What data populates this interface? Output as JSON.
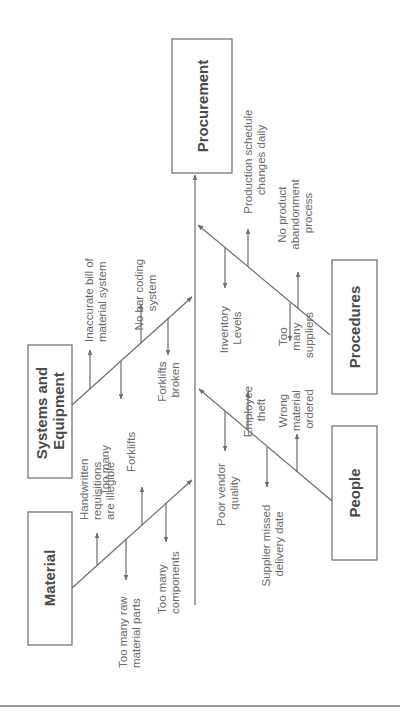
{
  "diagram": {
    "type": "fishbone",
    "orientation": "rotated-90-ccw",
    "effect": {
      "label": "Procurement"
    },
    "categories": [
      {
        "id": "material",
        "label": "Material",
        "causes": [
          {
            "lines": [
              "Handwritten",
              "requisitions",
              "are illegible"
            ]
          },
          {
            "lines": [
              "Too many raw",
              "material parts"
            ]
          },
          {
            "lines": [
              "Too many",
              "engineering",
              "changes"
            ]
          },
          {
            "lines": [
              "Too many",
              "components"
            ]
          }
        ]
      },
      {
        "id": "systems",
        "label_lines": [
          "Systems and",
          "Equipment"
        ],
        "causes": [
          {
            "lines": [
              "Inaccurate bill of",
              "material system"
            ]
          },
          {
            "lines": [
              "No bar coding",
              "system"
            ]
          },
          {
            "lines": [
              "Forklifts",
              "broken"
            ]
          }
        ]
      },
      {
        "id": "people",
        "label": "People",
        "causes": [
          {
            "lines": [
              "Poor vendor",
              "quality"
            ]
          },
          {
            "lines": [
              "Employee",
              "theft"
            ]
          },
          {
            "lines": [
              "Supplier missed",
              "delivery date"
            ]
          },
          {
            "lines": [
              "Wrong",
              "material",
              "ordered"
            ]
          }
        ]
      },
      {
        "id": "procedures",
        "label": "Procedures",
        "causes": [
          {
            "lines": [
              "Inventory",
              "Levels"
            ]
          },
          {
            "lines": [
              "Production schedule",
              "changes daily"
            ]
          },
          {
            "lines": [
              "Too",
              "many",
              "suppliers"
            ]
          },
          {
            "lines": [
              "No product",
              "abandonment",
              "process"
            ]
          }
        ]
      }
    ]
  },
  "colors": {
    "line": "#6e6e6e",
    "text": "#6a6a6a",
    "box_text": "#4a4a4a",
    "rule": "#9a9a9a"
  }
}
